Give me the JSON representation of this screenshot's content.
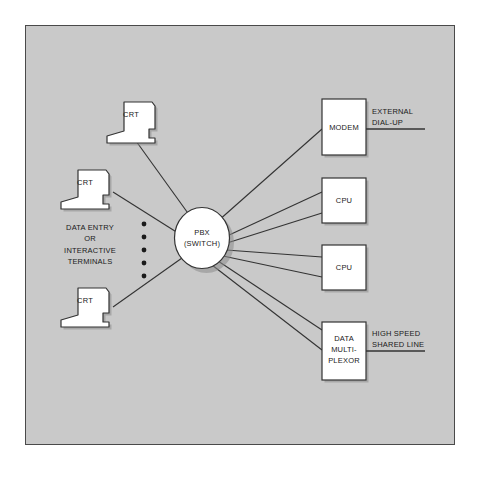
{
  "diagram": {
    "panel": {
      "background_color": "#c9c9c9",
      "border_color": "#4a4a4a"
    },
    "colors": {
      "page_background": "#ffffff",
      "node_fill": "#ffffff",
      "line_color": "#333333",
      "text_color": "#1a1a1a",
      "shadow_color": "#7a7a7a"
    },
    "center_node": {
      "name": "pbx-switch",
      "shape": "circle",
      "line1": "PBX",
      "line2": "(SWITCH)"
    },
    "terminals": [
      {
        "name": "crt-top",
        "label": "CRT"
      },
      {
        "name": "crt-middle",
        "label": "CRT"
      },
      {
        "name": "crt-bottom",
        "label": "CRT"
      }
    ],
    "terminal_group_label": "DATA ENTRY\nOR\nINTERACTIVE\nTERMINALS",
    "ellipsis_dots": 5,
    "right_nodes": [
      {
        "name": "modem",
        "label": "MODEM",
        "links": 1
      },
      {
        "name": "cpu-upper",
        "label": "CPU",
        "links": 2
      },
      {
        "name": "cpu-lower",
        "label": "CPU",
        "links": 2
      },
      {
        "name": "data-multiplexor",
        "label": "DATA\nMULTI-\nPLEXOR",
        "links": 2
      }
    ],
    "outbound_lines": [
      {
        "name": "external-dial-up",
        "label": "EXTERNAL\nDIAL-UP"
      },
      {
        "name": "high-speed-shared-line",
        "label": "HIGH SPEED\nSHARED LINE"
      }
    ]
  }
}
